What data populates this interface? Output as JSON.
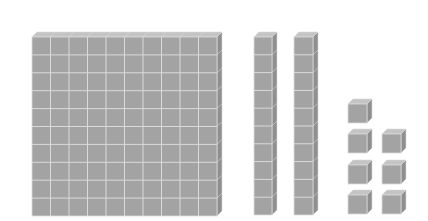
{
  "diagram": {
    "type": "base-ten-blocks",
    "colors": {
      "background": "#ffffff",
      "face": "#a3a3a3",
      "top": "#c4c4c4",
      "side": "#8f8f8f",
      "grid": "#dadada"
    },
    "hundreds": [
      {
        "x": 32,
        "y": 37,
        "w": 185,
        "h": 179,
        "cols": 10,
        "rows": 10,
        "depth": 5
      }
    ],
    "tens": [
      {
        "x": 254,
        "y": 37,
        "w": 18,
        "h": 178,
        "rows": 10,
        "depth": 5
      },
      {
        "x": 294,
        "y": 37,
        "w": 19,
        "h": 178,
        "rows": 10,
        "depth": 5
      }
    ],
    "ones": [
      {
        "x": 348,
        "y": 104,
        "s": 19,
        "depth": 5
      },
      {
        "x": 348,
        "y": 134,
        "s": 19,
        "depth": 5
      },
      {
        "x": 382,
        "y": 134,
        "s": 19,
        "depth": 5
      },
      {
        "x": 348,
        "y": 165,
        "s": 19,
        "depth": 5
      },
      {
        "x": 382,
        "y": 165,
        "s": 19,
        "depth": 5
      },
      {
        "x": 348,
        "y": 195,
        "s": 19,
        "depth": 5
      },
      {
        "x": 382,
        "y": 195,
        "s": 19,
        "depth": 5
      }
    ],
    "counts": {
      "hundreds": 1,
      "tens": 2,
      "ones": 7
    }
  }
}
